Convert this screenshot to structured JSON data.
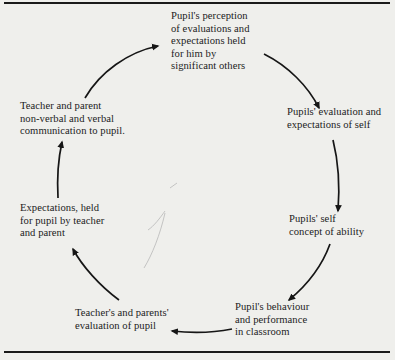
{
  "diagram": {
    "type": "cycle",
    "nodes": [
      {
        "id": "perception",
        "lines": [
          "Pupil's perception",
          "of evaluations and",
          "expectations held",
          "for him by",
          "significant others"
        ]
      },
      {
        "id": "self-evaluation",
        "lines": [
          "Pupils' evaluation and",
          "expectations of self"
        ]
      },
      {
        "id": "self-concept",
        "lines": [
          "Pupils' self",
          "concept of ability"
        ]
      },
      {
        "id": "behaviour",
        "lines": [
          "Pupil's behaviour",
          "and performance",
          "in classroom"
        ]
      },
      {
        "id": "teacher-evaluation",
        "lines": [
          "Teacher's and parents'",
          "evaluation of pupil"
        ]
      },
      {
        "id": "expectations",
        "lines": [
          "Expectations, held",
          "for pupil by teacher",
          "and parent"
        ]
      },
      {
        "id": "communication",
        "lines": [
          "Teacher and parent",
          "non-verbal and verbal",
          "communication to pupil."
        ]
      }
    ],
    "edges": [
      {
        "from": "communication",
        "to": "perception"
      },
      {
        "from": "perception",
        "to": "self-evaluation"
      },
      {
        "from": "self-evaluation",
        "to": "self-concept"
      },
      {
        "from": "self-concept",
        "to": "behaviour"
      },
      {
        "from": "behaviour",
        "to": "teacher-evaluation"
      },
      {
        "from": "teacher-evaluation",
        "to": "expectations"
      },
      {
        "from": "expectations",
        "to": "communication"
      }
    ],
    "colors": {
      "background": "#efefec",
      "ink": "#1c1c1c",
      "rule": "#1a1a1a"
    }
  }
}
